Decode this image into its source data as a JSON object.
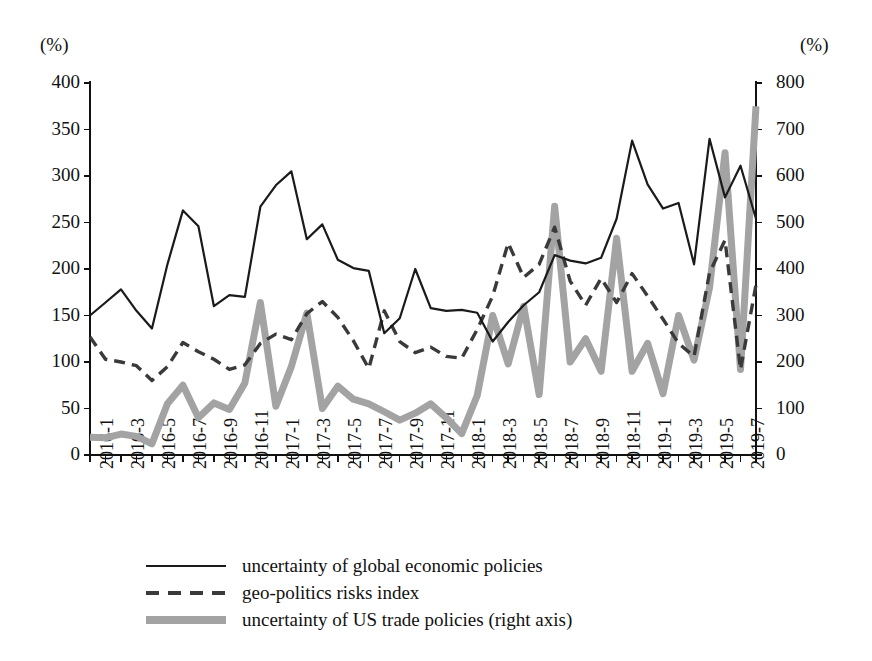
{
  "chart_data": {
    "type": "line",
    "title": "",
    "subtitle": "",
    "xlabel": "",
    "ylabel": "(%)",
    "y2label": "(%)",
    "grid": false,
    "legend_position": "bottom",
    "ylim": [
      0,
      400
    ],
    "y2lim": [
      0,
      800
    ],
    "yticks": [
      0,
      50,
      100,
      150,
      200,
      250,
      300,
      350,
      400
    ],
    "y2ticks": [
      0,
      100,
      200,
      300,
      400,
      500,
      600,
      700,
      800
    ],
    "x": [
      "2016-1",
      "2016-2",
      "2016-3",
      "2016-4",
      "2016-5",
      "2016-6",
      "2016-7",
      "2016-8",
      "2016-9",
      "2016-10",
      "2016-11",
      "2016-12",
      "2017-1",
      "2017-2",
      "2017-3",
      "2017-4",
      "2017-5",
      "2017-6",
      "2017-7",
      "2017-8",
      "2017-9",
      "2017-10",
      "2017-11",
      "2017-12",
      "2018-1",
      "2018-2",
      "2018-3",
      "2018-4",
      "2018-5",
      "2018-6",
      "2018-7",
      "2018-8",
      "2018-9",
      "2018-10",
      "2018-11",
      "2018-12",
      "2019-1",
      "2019-2",
      "2019-3",
      "2019-4",
      "2019-5",
      "2019-6",
      "2019-7",
      "2019-8"
    ],
    "xtick_labels": [
      "2016-1",
      "2016-3",
      "2016-5",
      "2016-7",
      "2016-9",
      "2016-11",
      "2017-1",
      "2017-3",
      "2017-5",
      "2017-7",
      "2017-9",
      "2017-11",
      "2018-1",
      "2018-3",
      "2018-5",
      "2018-7",
      "2018-9",
      "2018-11",
      "2019-1",
      "2019-3",
      "2019-5",
      "2019-7"
    ],
    "xtick_indices": [
      0,
      2,
      4,
      6,
      8,
      10,
      12,
      14,
      16,
      18,
      20,
      22,
      24,
      26,
      28,
      30,
      32,
      34,
      36,
      38,
      40,
      42
    ],
    "series": [
      {
        "name": "uncertainty of global economic policies",
        "axis": "left",
        "style": "solid",
        "color": "#1a1a1a",
        "values": [
          150,
          164,
          178,
          155,
          136,
          205,
          263,
          246,
          160,
          172,
          170,
          267,
          290,
          305,
          232,
          248,
          210,
          201,
          198,
          131,
          147,
          200,
          158,
          155,
          156,
          153,
          122,
          143,
          161,
          175,
          215,
          209,
          206,
          212,
          254,
          338,
          291,
          265,
          271,
          205,
          340,
          277,
          311,
          254
        ]
      },
      {
        "name": "geo-politics risks index",
        "axis": "left",
        "style": "dashed",
        "color": "#3a3a3a",
        "values": [
          127,
          103,
          100,
          96,
          80,
          95,
          121,
          111,
          103,
          92,
          97,
          120,
          130,
          124,
          152,
          165,
          148,
          123,
          93,
          155,
          122,
          110,
          116,
          106,
          104,
          135,
          171,
          228,
          191,
          205,
          245,
          187,
          161,
          190,
          164,
          195,
          171,
          146,
          120,
          106,
          196,
          231,
          92,
          183
        ]
      },
      {
        "name": "uncertainty of US trade policies (right axis)",
        "axis": "right",
        "style": "thick",
        "color": "#a3a3a3",
        "values": [
          38,
          37,
          45,
          40,
          24,
          110,
          150,
          80,
          112,
          98,
          155,
          328,
          105,
          190,
          305,
          100,
          148,
          120,
          110,
          93,
          75,
          90,
          110,
          80,
          46,
          128,
          300,
          196,
          320,
          130,
          535,
          200,
          250,
          180,
          466,
          180,
          240,
          132,
          300,
          204,
          360,
          650,
          184,
          750
        ]
      }
    ]
  },
  "legend": {
    "items": [
      {
        "label": "uncertainty of global economic policies",
        "key": "solid-line-key"
      },
      {
        "label": "geo-politics risks index",
        "key": "dashed-line-key"
      },
      {
        "label": "uncertainty of US trade policies (right axis)",
        "key": "thick-line-key"
      }
    ]
  },
  "axes": {
    "left_unit": "(%)",
    "right_unit": "(%)"
  },
  "colors": {
    "solid_series": "#1a1a1a",
    "dashed_series": "#3a3a3a",
    "thick_series": "#a3a3a3",
    "axis": "#111111",
    "background": "#ffffff"
  }
}
